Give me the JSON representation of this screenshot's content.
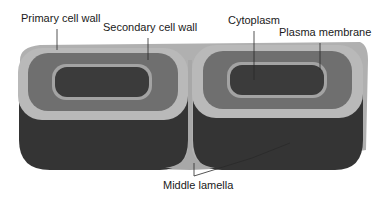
{
  "diagram": {
    "labels": {
      "primary_cell_wall": "Primary cell wall",
      "secondary_cell_wall": "Secondary cell wall",
      "cytoplasm": "Cytoplasm",
      "plasma_membrane": "Plasma membrane",
      "middle_lamella": "Middle lamella"
    },
    "colors": {
      "primary_wall": "#b9b9b9",
      "secondary_wall": "#6f6f6f",
      "plasma_membrane": "#a3a3a3",
      "cytoplasm": "#3b3b3b",
      "cell_side": "#343434",
      "middle_lamella": "#a8a8a8",
      "leader_line": "#2a2a2a"
    }
  }
}
